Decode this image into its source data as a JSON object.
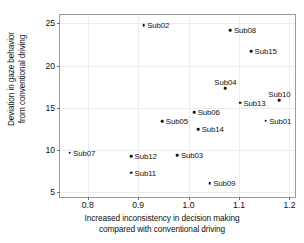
{
  "chart_data": {
    "type": "scatter",
    "title": "",
    "xlabel": "Increased inconsistency in decision making compared with conventional driving",
    "xlabel_lines": [
      "Increased inconsistency in decision making",
      "compared with conventional driving"
    ],
    "ylabel": "Deviation in gaze behavior from conventional driving",
    "ylabel_lines": [
      "Deviation in gaze behavior",
      "from conventional driving"
    ],
    "xlim": [
      0.745,
      1.215
    ],
    "ylim": [
      4.2,
      26.0
    ],
    "xticks": [
      0.8,
      0.9,
      1.0,
      1.1,
      1.2
    ],
    "xtick_labels": [
      "0.8",
      "0.9",
      "1.0",
      "1.1",
      "1.2"
    ],
    "yticks": [
      5,
      10,
      15,
      20,
      25
    ],
    "ytick_labels": [
      "5",
      "10",
      "15",
      "20",
      "25"
    ],
    "grid": true,
    "legend": "none",
    "marker_color": "#141414",
    "frame_color": "#9a9a9a",
    "grid_color": "#ececec",
    "points": [
      {
        "label": "Sub01",
        "x": 1.153,
        "y": 13.5,
        "label_pos": "right"
      },
      {
        "label": "Sub02",
        "x": 0.911,
        "y": 24.8,
        "label_pos": "right"
      },
      {
        "label": "Sub03",
        "x": 0.978,
        "y": 9.4,
        "label_pos": "right"
      },
      {
        "label": "Sub04",
        "x": 1.073,
        "y": 17.3,
        "label_pos": "above"
      },
      {
        "label": "Sub05",
        "x": 0.948,
        "y": 13.4,
        "label_pos": "right"
      },
      {
        "label": "Sub06",
        "x": 1.011,
        "y": 14.5,
        "label_pos": "right"
      },
      {
        "label": "Sub07",
        "x": 0.764,
        "y": 9.7,
        "label_pos": "right"
      },
      {
        "label": "Sub08",
        "x": 1.083,
        "y": 24.2,
        "label_pos": "right"
      },
      {
        "label": "Sub09",
        "x": 1.042,
        "y": 6.1,
        "label_pos": "right"
      },
      {
        "label": "Sub10",
        "x": 1.18,
        "y": 15.9,
        "label_pos": "above"
      },
      {
        "label": "Sub11",
        "x": 0.886,
        "y": 7.3,
        "label_pos": "right"
      },
      {
        "label": "Sub12",
        "x": 0.886,
        "y": 9.3,
        "label_pos": "right"
      },
      {
        "label": "Sub13",
        "x": 1.102,
        "y": 15.6,
        "label_pos": "right"
      },
      {
        "label": "Sub14",
        "x": 1.019,
        "y": 12.5,
        "label_pos": "right"
      },
      {
        "label": "Sub15",
        "x": 1.124,
        "y": 21.7,
        "label_pos": "right"
      }
    ]
  }
}
